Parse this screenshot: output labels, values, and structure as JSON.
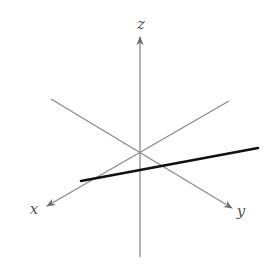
{
  "diagram": {
    "type": "3d-coordinate-axes",
    "colors": {
      "axis": "#8a8a8a",
      "arrow": "#6e6e6e",
      "line": "#111111",
      "label": "#555555",
      "background": "#ffffff"
    },
    "origin": [
      140,
      152
    ],
    "axes": [
      {
        "name": "x",
        "label": "x",
        "from": [
          229,
          101
        ],
        "to": [
          47,
          206
        ],
        "label_pos": [
          34,
          214
        ]
      },
      {
        "name": "y",
        "label": "y",
        "from": [
          51,
          99
        ],
        "to": [
          232,
          208
        ],
        "label_pos": [
          241,
          216
        ]
      },
      {
        "name": "z",
        "label": "z",
        "from": [
          140,
          257
        ],
        "to": [
          140,
          37
        ],
        "label_pos": [
          141,
          29
        ]
      }
    ],
    "line": {
      "from": [
        81,
        181
      ],
      "to": [
        258,
        148
      ],
      "width": 2.6
    }
  }
}
